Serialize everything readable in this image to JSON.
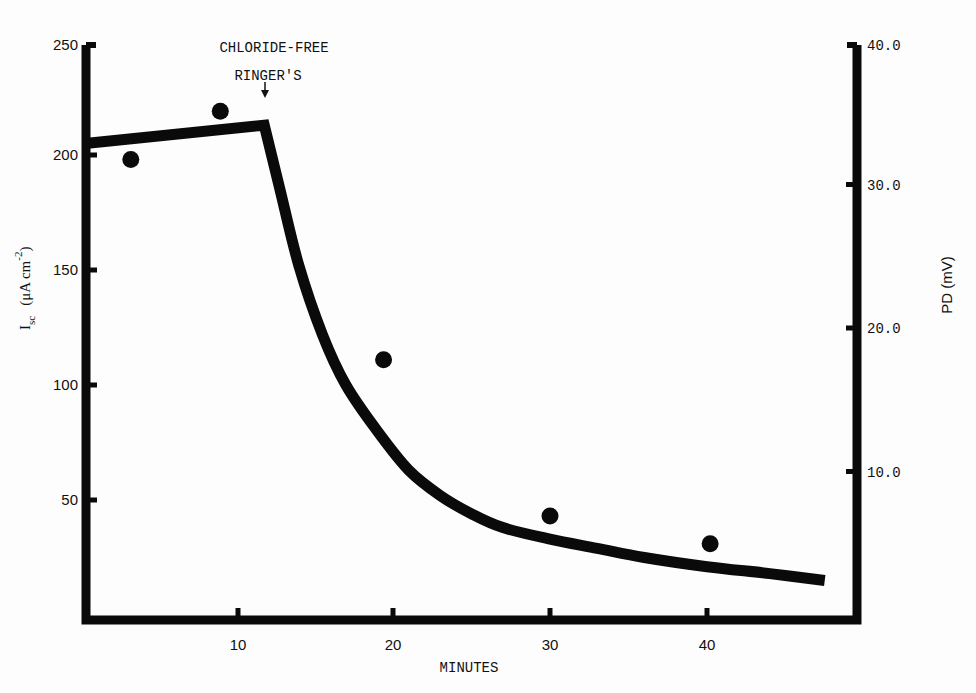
{
  "chart_data": {
    "type": "line",
    "title": "",
    "xlabel": "MINUTES",
    "ylabel": "I_sc (μA cm^-2)",
    "ylabel_parts": {
      "main": "I",
      "sub": "sc",
      "units_open": "(μA cm",
      "sup": "-2",
      "units_close": ")"
    },
    "y2label": "PD (mV)",
    "xlim": [
      0,
      49
    ],
    "ylim": [
      0,
      250
    ],
    "y2lim": [
      0,
      40
    ],
    "x_ticks": [
      10,
      20,
      30,
      40
    ],
    "x_tick_labels": [
      "10",
      "20",
      "30",
      "40"
    ],
    "y_ticks": [
      50,
      100,
      150,
      200,
      250
    ],
    "y_tick_labels": [
      "50",
      "100",
      "150",
      "200",
      "250"
    ],
    "y2_ticks": [
      10,
      20,
      30,
      40
    ],
    "y2_tick_labels": [
      "10.0",
      "20.0",
      "30.0",
      "40.0"
    ],
    "grid": false,
    "legend": null,
    "annotation": {
      "line1": "CHLORIDE-FREE",
      "line2": "RINGER'S",
      "x": 11.8,
      "arrow": "down"
    },
    "series": [
      {
        "name": "Isc (curve)",
        "style": "thick-line",
        "x": [
          0.4,
          11.8,
          12.8,
          14,
          15.5,
          17,
          19,
          21,
          23,
          25,
          27,
          30,
          33,
          36,
          40,
          44,
          47.5
        ],
        "values": [
          205,
          213,
          185,
          152,
          122,
          100,
          80,
          63,
          52,
          44,
          38,
          33,
          29,
          25,
          21,
          18,
          15
        ]
      },
      {
        "name": "PD (points)",
        "style": "filled-circle",
        "axis": "right",
        "x": [
          3.3,
          9.0,
          19.4,
          30.0,
          40.2
        ],
        "values_left_scale": [
          198,
          219,
          111,
          43,
          31
        ],
        "values": [
          31.7,
          35.0,
          17.8,
          6.9,
          5.0
        ]
      }
    ]
  }
}
